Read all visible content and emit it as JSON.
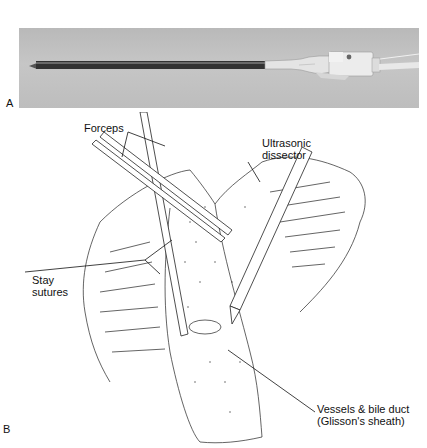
{
  "figure": {
    "panels": [
      {
        "id": "A",
        "label": "A",
        "type": "photograph",
        "subject": "ultrasonic-dissector-instrument"
      },
      {
        "id": "B",
        "label": "B",
        "type": "line-illustration",
        "subject": "liver-parenchymal-dissection"
      }
    ],
    "annotations": {
      "forceps": "Forceps",
      "ultrasonic_line1": "Ultrasonic",
      "ultrasonic_line2": "dissector",
      "stay_line1": "Stay",
      "stay_line2": "sutures",
      "vessels_line1": "Vessels & bile duct",
      "vessels_line2": "(Glisson's sheath)"
    },
    "colors": {
      "photo_background": "#bfbfbf",
      "line_art": "#222222",
      "instrument_shaft": "#3a3a3a",
      "handpiece": "#e6e6e6"
    }
  }
}
